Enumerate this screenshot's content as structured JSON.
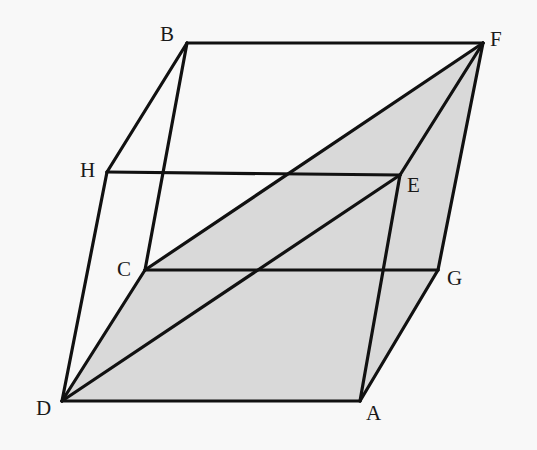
{
  "figure": {
    "type": "geometry-diagram",
    "colors": {
      "stroke": "#111111",
      "shade": "#d9d9d9",
      "background": "#f8f8f8"
    },
    "vertices": {
      "B": {
        "label": "B",
        "x": 187,
        "y": 43
      },
      "F": {
        "label": "F",
        "x": 483,
        "y": 43
      },
      "H": {
        "label": "H",
        "x": 107,
        "y": 172
      },
      "E": {
        "label": "E",
        "x": 400,
        "y": 175
      },
      "C": {
        "label": "C",
        "x": 145,
        "y": 270
      },
      "G": {
        "label": "G",
        "x": 438,
        "y": 270
      },
      "D": {
        "label": "D",
        "x": 62,
        "y": 401
      },
      "A": {
        "label": "A",
        "x": 360,
        "y": 401
      }
    },
    "shaded_polygon": [
      "D",
      "C",
      "F",
      "G",
      "A"
    ],
    "edges": [
      [
        "B",
        "F"
      ],
      [
        "B",
        "H"
      ],
      [
        "B",
        "C"
      ],
      [
        "H",
        "E"
      ],
      [
        "H",
        "D"
      ],
      [
        "E",
        "F"
      ],
      [
        "E",
        "A"
      ],
      [
        "E",
        "D"
      ],
      [
        "F",
        "G"
      ],
      [
        "F",
        "C"
      ],
      [
        "C",
        "G"
      ],
      [
        "C",
        "D"
      ],
      [
        "G",
        "A"
      ],
      [
        "D",
        "A"
      ]
    ]
  }
}
